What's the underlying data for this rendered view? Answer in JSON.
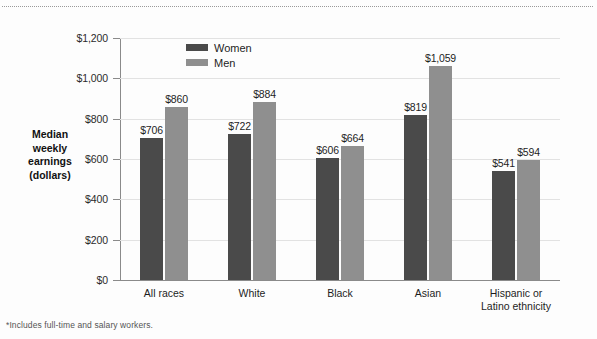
{
  "figure": {
    "footnote": "*Includes full-time and salary workers."
  },
  "chart_data": {
    "type": "bar",
    "title": "",
    "subtitle": "",
    "xlabel": "",
    "ylabel": "Median weekly earnings (dollars)",
    "ylabel_lines": [
      "Median",
      "weekly",
      "earnings",
      "(dollars)"
    ],
    "ylim": [
      0,
      1200
    ],
    "ytick_values": [
      0,
      200,
      400,
      600,
      800,
      1000,
      1200
    ],
    "ytick_labels": [
      "$0",
      "$200",
      "$400",
      "$600",
      "$800",
      "$1,000",
      "$1,200"
    ],
    "grid": true,
    "legend_position": "inside-top-left",
    "categories": [
      "All races",
      "White",
      "Black",
      "Asian",
      "Hispanic or Latino ethnicity"
    ],
    "category_label_lines": [
      [
        "All races"
      ],
      [
        "White"
      ],
      [
        "Black"
      ],
      [
        "Asian"
      ],
      [
        "Hispanic or",
        "Latino ethnicity"
      ]
    ],
    "series": [
      {
        "name": "Women",
        "color": "#4a4a4a",
        "values": [
          706,
          722,
          606,
          819,
          541
        ],
        "value_labels": [
          "$706",
          "$722",
          "$606",
          "$819",
          "$541"
        ]
      },
      {
        "name": "Men",
        "color": "#8f8f8f",
        "values": [
          860,
          884,
          664,
          1059,
          594
        ],
        "value_labels": [
          "$860",
          "$884",
          "$664",
          "$1,059",
          "$594"
        ]
      }
    ]
  }
}
